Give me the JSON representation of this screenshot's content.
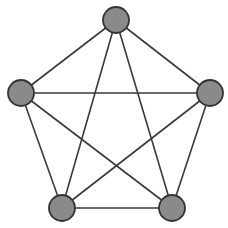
{
  "figure": {
    "background_color": "#ffffff",
    "width": 228,
    "height": 228
  },
  "style": {
    "node_fill": "#8a8a8a",
    "node_stroke": "#333333",
    "node_stroke_width": 1.8,
    "node_radius": 13,
    "edge_color": "#3a3a3a",
    "edge_width": 1.6
  },
  "chart_data": {
    "type": "diagram",
    "graph_type": "complete-graph",
    "name": "K5",
    "node_count": 5,
    "edge_count": 10,
    "layout": "pentagon",
    "nodes": [
      {
        "id": "n0",
        "label": "",
        "x": 116,
        "y": 20
      },
      {
        "id": "n1",
        "label": "",
        "x": 210,
        "y": 93
      },
      {
        "id": "n2",
        "label": "",
        "x": 172,
        "y": 208
      },
      {
        "id": "n3",
        "label": "",
        "x": 62,
        "y": 208
      },
      {
        "id": "n4",
        "label": "",
        "x": 21,
        "y": 93
      }
    ],
    "edges": [
      {
        "from": "n0",
        "to": "n1",
        "kind": "side"
      },
      {
        "from": "n1",
        "to": "n2",
        "kind": "side"
      },
      {
        "from": "n2",
        "to": "n3",
        "kind": "side"
      },
      {
        "from": "n3",
        "to": "n4",
        "kind": "side"
      },
      {
        "from": "n4",
        "to": "n0",
        "kind": "side"
      },
      {
        "from": "n0",
        "to": "n2",
        "kind": "diagonal"
      },
      {
        "from": "n0",
        "to": "n3",
        "kind": "diagonal"
      },
      {
        "from": "n1",
        "to": "n3",
        "kind": "diagonal"
      },
      {
        "from": "n1",
        "to": "n4",
        "kind": "diagonal"
      },
      {
        "from": "n2",
        "to": "n4",
        "kind": "diagonal"
      }
    ]
  }
}
